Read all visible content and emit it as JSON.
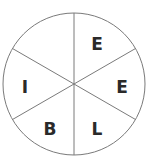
{
  "wheel": {
    "segments": [
      {
        "position": "top-left",
        "letter": ""
      },
      {
        "position": "top-right",
        "letter": "E"
      },
      {
        "position": "right",
        "letter": "E"
      },
      {
        "position": "bottom-right",
        "letter": "L"
      },
      {
        "position": "bottom-left",
        "letter": "B"
      },
      {
        "position": "left",
        "letter": "I"
      }
    ],
    "stroke_color": "#7a7a7a",
    "letter_color": "#2a2a2a"
  }
}
